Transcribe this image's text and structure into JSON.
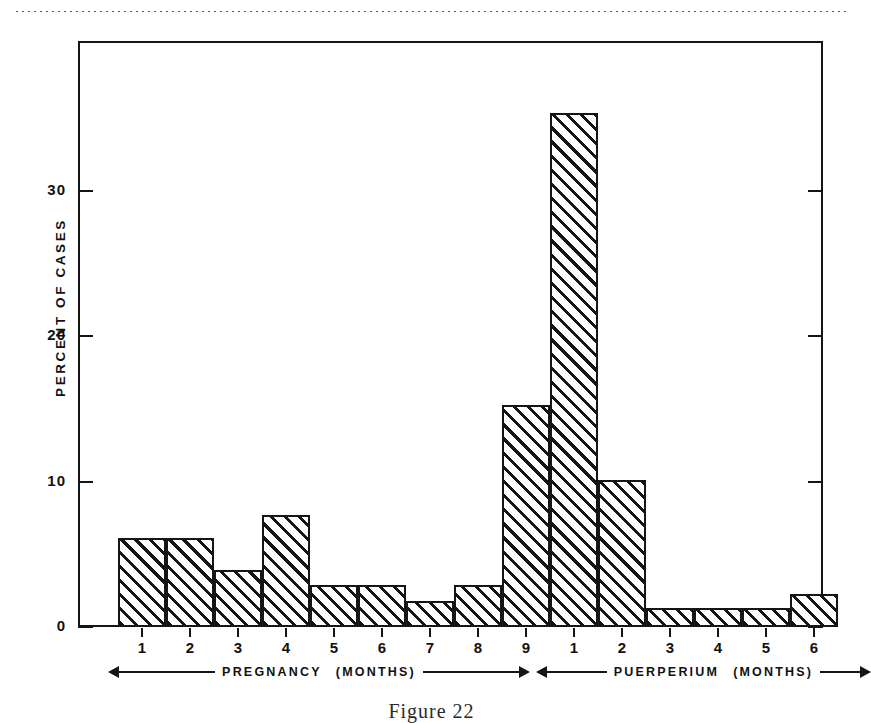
{
  "figure": {
    "caption": "Figure 22"
  },
  "chart_data": {
    "type": "bar",
    "title": "",
    "xlabel": "",
    "ylabel": "PERCENT OF CASES",
    "ylim": [
      0,
      38
    ],
    "yticks": [
      0,
      10,
      20,
      30
    ],
    "ytick_labels": [
      "0",
      "10",
      "20",
      "30"
    ],
    "grid": false,
    "legend": null,
    "categories": [
      "1",
      "2",
      "3",
      "4",
      "5",
      "6",
      "7",
      "8",
      "9",
      "1",
      "2",
      "3",
      "4",
      "5",
      "6"
    ],
    "values": [
      6.1,
      6.1,
      3.9,
      7.7,
      2.9,
      2.9,
      1.8,
      2.9,
      15.3,
      35.4,
      10.1,
      1.3,
      1.3,
      1.3,
      2.3
    ],
    "groups": [
      {
        "name": "PREGNANCY",
        "units": "(MONTHS)",
        "categories": [
          "1",
          "2",
          "3",
          "4",
          "5",
          "6",
          "7",
          "8",
          "9"
        ],
        "values": [
          6.1,
          6.1,
          3.9,
          7.7,
          2.9,
          2.9,
          1.8,
          2.9,
          15.3
        ]
      },
      {
        "name": "PUERPERIUM",
        "units": "(MONTHS)",
        "categories": [
          "1",
          "2",
          "3",
          "4",
          "5",
          "6"
        ],
        "values": [
          35.4,
          10.1,
          1.3,
          1.3,
          1.3,
          2.3
        ]
      }
    ],
    "bar_fill": "diagonal-hatch",
    "bar_edge_color": "#151515",
    "bar_face_color": "#ffffff"
  },
  "axes": {
    "y_title": "PERCENT OF CASES",
    "y_ticks": [
      {
        "label": "30",
        "value": 30
      },
      {
        "label": "20",
        "value": 20
      },
      {
        "label": "10",
        "value": 10
      },
      {
        "label": "0",
        "value": 0
      }
    ],
    "x_labels": [
      "1",
      "2",
      "3",
      "4",
      "5",
      "6",
      "7",
      "8",
      "9",
      "1",
      "2",
      "3",
      "4",
      "5",
      "6"
    ]
  },
  "bands": {
    "pregnancy": {
      "name": "PREGNANCY",
      "units": "(MONTHS)"
    },
    "puerperium": {
      "name": "PUERPERIUM",
      "units": "(MONTHS)"
    }
  }
}
